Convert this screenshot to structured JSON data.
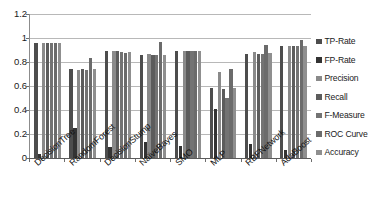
{
  "chart_data": {
    "type": "bar",
    "title": "",
    "subtitle": "",
    "xlabel": "",
    "ylabel": "",
    "ylim": [
      0,
      1.2
    ],
    "yticks": [
      0,
      0.2,
      0.4,
      0.6,
      0.8,
      1,
      1.2
    ],
    "ytick_labels": [
      "0",
      "0.2",
      "0.4",
      "0.6",
      "0.8",
      "1",
      "1.2"
    ],
    "grid": true,
    "legend_position": "right",
    "orientation": "vertical",
    "grouping": "clustered",
    "categories": [
      "DecisionTree",
      "RandomForest",
      "DecisionStump",
      "NaïveBayes",
      "SMO",
      "MLP",
      "RBFNetwork",
      "AdaBoost"
    ],
    "series": [
      {
        "name": "TP-Rate",
        "color": "#4d4d4d",
        "values": [
          0.96,
          0.745,
          0.895,
          0.86,
          0.89,
          0.58,
          0.87,
          0.935
        ]
      },
      {
        "name": "FP-Rate",
        "color": "#333333",
        "values": [
          0.03,
          0.25,
          0.09,
          0.135,
          0.1,
          0.41,
          0.115,
          0.065
        ]
      },
      {
        "name": "Precision",
        "color": "#8a8a8a",
        "values": [
          0.96,
          0.735,
          0.895,
          0.87,
          0.89,
          0.72,
          0.88,
          0.935
        ]
      },
      {
        "name": "Recall",
        "color": "#5c5c5c",
        "values": [
          0.96,
          0.745,
          0.895,
          0.86,
          0.89,
          0.575,
          0.87,
          0.935
        ]
      },
      {
        "name": "F-Measure",
        "color": "#737373",
        "values": [
          0.955,
          0.735,
          0.885,
          0.86,
          0.89,
          0.5,
          0.87,
          0.93
        ]
      },
      {
        "name": "ROC Curve",
        "color": "#6b6b6b",
        "values": [
          0.96,
          0.835,
          0.875,
          0.97,
          0.89,
          0.745,
          0.945,
          0.98
        ]
      },
      {
        "name": "Accuracy",
        "color": "#8f8f8f",
        "values": [
          0.955,
          0.74,
          0.885,
          0.86,
          0.89,
          0.58,
          0.875,
          0.93
        ]
      }
    ]
  },
  "legend": {
    "items": [
      {
        "label": "TP-Rate"
      },
      {
        "label": "FP-Rate"
      },
      {
        "label": "Precision"
      },
      {
        "label": "Recall"
      },
      {
        "label": "F-Measure"
      },
      {
        "label": "ROC Curve"
      },
      {
        "label": "Accuracy"
      }
    ]
  }
}
